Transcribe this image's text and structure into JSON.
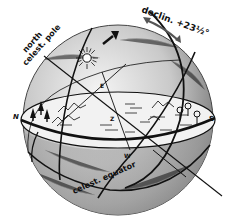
{
  "diagram": {
    "type": "celestial-sphere",
    "labels": {
      "north_celestial_pole_line1": "north",
      "north_celestial_pole_line2": "celest. pole",
      "declination": "declin. +23½°",
      "celestial_equator": "celest. equator",
      "north": "N",
      "south": "S",
      "east": "E",
      "west": "W",
      "zenith": "Z"
    },
    "colors": {
      "ink": "#111111",
      "sphere_light": "#e6e6e6",
      "sphere_dark": "#6a6a6a",
      "horizon_plane": "#f2f2f2",
      "background": "#ffffff"
    },
    "icons": [
      "sun-icon",
      "direction-arrow-icon",
      "trees-icon",
      "mountains-icon",
      "lollipop-trees-icon"
    ]
  }
}
